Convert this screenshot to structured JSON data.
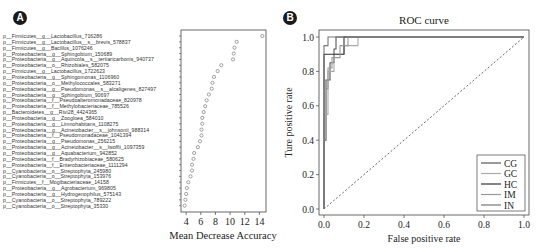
{
  "panels": {
    "a": {
      "badge": "A"
    },
    "b": {
      "badge": "B"
    }
  },
  "chart_data": [
    {
      "type": "scatter",
      "title": "",
      "xlabel": "Mean Decrease Accuracy",
      "ylabel": "",
      "xlim": [
        3.3,
        14.9
      ],
      "xticks": [
        "4",
        "6",
        "8",
        "10",
        "12",
        "14"
      ],
      "grid": false,
      "categories": [
        "p__Firmicutes__g__Lactobacillus_716286",
        "p__Firmicutes__g__Lactobacillus__s__brevis_578837",
        "p__Firmicutes__g__Bacillus_1076246",
        "p__Proteobacteria__g__Sphingobium_150689",
        "p__Proteobacteria__g__Aquincola__s__tertiaricarbonis_940737",
        "p__Proteobacteria__o__Rhizobiales_582075",
        "p__Firmicutes__g__Lactobacillus_1722623",
        "p__Proteobacteria__g__Sphingomonas_1106960",
        "p__Proteobacteria__o__Methylococcales_583271",
        "p__Proteobacteria__g__Pseudomonas__s__alcaligenes_827497",
        "p__Proteobacteria__g__Sphingobium_90697",
        "p__Proteobacteria__f__Pseudoalteromonadaceae_820978",
        "p__Proteobacteria__f__Methylobacteriaceae_785526",
        "p__Bacteroidetes__g__Rivi28_4424365",
        "p__Proteobacteria__g__Zoogloea_584010",
        "p__Proteobacteria__g__Limnohabitans_1108275",
        "p__Proteobacteria__g__Acinetobacter__s__johnsonii_988314",
        "p__Proteobacteria__f__Pseudomonadaceae_1041394",
        "p__Proteobacteria__g__Pseudomonas_256215",
        "p__Proteobacteria__g__Acinetobacter__s__lwoffii_1097359",
        "p__Proteobacteria__g__Aquabacterium_942852",
        "p__Proteobacteria__f__Bradyrhizobiaceae_580625",
        "p__Proteobacteria__f__Enterobacteriaceae_1111294",
        "p__Cyanobacteria__o__Streptophyta_245980",
        "p__Cyanobacteria__o__Streptophyta_153976",
        "p__Firmicutes__f__Mogibacteriaceae_14158",
        "p__Proteobacteria__g__Agrobacterium_969805",
        "p__Proteobacteria__g__Hydrogenophilus_575143",
        "p__Cyanobacteria__o__Streptophyta_789222",
        "p__Cyanobacteria__o__Streptophyta_35330"
      ],
      "values": [
        14.4,
        10.9,
        10.6,
        10.5,
        10.4,
        8.8,
        8.3,
        7.8,
        7.6,
        7.5,
        7.1,
        6.8,
        6.6,
        6.4,
        6.2,
        6.2,
        6.1,
        6.1,
        5.9,
        5.6,
        5.1,
        5.0,
        4.8,
        4.8,
        4.6,
        4.3,
        4.1,
        4.0,
        3.9,
        3.8
      ]
    },
    {
      "type": "line",
      "title": "ROC curve",
      "xlabel": "False positive rate",
      "ylabel": "Ture positive rate",
      "xlim": [
        0,
        1
      ],
      "ylim": [
        0,
        1
      ],
      "xticks": [
        "0.0",
        "0.2",
        "0.4",
        "0.6",
        "0.8",
        "1.0"
      ],
      "yticks": [
        "0.0",
        "0.2",
        "0.4",
        "0.6",
        "0.8",
        "1.0"
      ],
      "grid": false,
      "legend_position": "lower right",
      "diagonal_reference": true,
      "series": [
        {
          "name": "CG",
          "color": "#555555",
          "x": [
            0,
            0,
            0.01,
            0.01,
            0.03,
            0.03,
            0.05,
            0.05,
            0.06,
            0.06,
            1
          ],
          "y": [
            0,
            0.4,
            0.4,
            0.75,
            0.75,
            0.85,
            0.85,
            0.93,
            0.93,
            1.0,
            1.0
          ]
        },
        {
          "name": "GC",
          "color": "#aaaaaa",
          "x": [
            0,
            0,
            0.02,
            0.02,
            0.05,
            0.05,
            0.1,
            0.1,
            0.17,
            0.17,
            1
          ],
          "y": [
            0,
            0.55,
            0.55,
            0.8,
            0.8,
            0.9,
            0.9,
            0.95,
            0.95,
            1.0,
            1.0
          ]
        },
        {
          "name": "HC",
          "color": "#333333",
          "x": [
            0,
            0,
            0.0,
            0.1,
            0.1,
            1
          ],
          "y": [
            0,
            0.9,
            0.9,
            0.9,
            1.0,
            1.0
          ]
        },
        {
          "name": "IM",
          "color": "#999999",
          "x": [
            0,
            0,
            0.02,
            0.02,
            0.04,
            0.04,
            0.08,
            0.08,
            0.12,
            0.12,
            1
          ],
          "y": [
            0,
            0.7,
            0.7,
            0.82,
            0.82,
            0.88,
            0.88,
            0.95,
            0.95,
            1.0,
            1.0
          ]
        },
        {
          "name": "IN",
          "color": "#777777",
          "x": [
            0,
            0,
            0.0,
            0.02,
            0.02,
            1
          ],
          "y": [
            0,
            0.95,
            0.95,
            0.95,
            1.0,
            1.0
          ]
        }
      ]
    }
  ]
}
